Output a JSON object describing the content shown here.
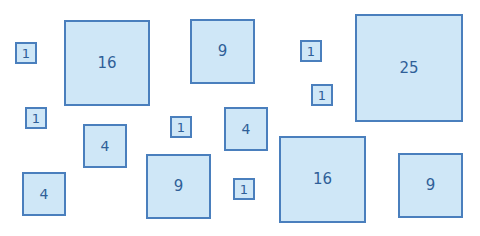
{
  "diagram": {
    "colors": {
      "fill": "#cfe7f7",
      "border": "#4a7fbd",
      "label": "#2f5f98",
      "background": "#ffffff"
    },
    "squares": [
      {
        "label": "1",
        "x": 15,
        "y": 42,
        "size": 22
      },
      {
        "label": "16",
        "x": 64,
        "y": 20,
        "size": 86
      },
      {
        "label": "9",
        "x": 190,
        "y": 19,
        "size": 65
      },
      {
        "label": "1",
        "x": 300,
        "y": 40,
        "size": 22
      },
      {
        "label": "25",
        "x": 355,
        "y": 14,
        "size": 108
      },
      {
        "label": "1",
        "x": 311,
        "y": 84,
        "size": 22
      },
      {
        "label": "1",
        "x": 25,
        "y": 107,
        "size": 22
      },
      {
        "label": "4",
        "x": 83,
        "y": 124,
        "size": 44
      },
      {
        "label": "1",
        "x": 170,
        "y": 116,
        "size": 22
      },
      {
        "label": "4",
        "x": 224,
        "y": 107,
        "size": 44
      },
      {
        "label": "4",
        "x": 22,
        "y": 172,
        "size": 44
      },
      {
        "label": "9",
        "x": 146,
        "y": 154,
        "size": 65
      },
      {
        "label": "1",
        "x": 233,
        "y": 178,
        "size": 22
      },
      {
        "label": "16",
        "x": 279,
        "y": 136,
        "size": 87
      },
      {
        "label": "9",
        "x": 398,
        "y": 153,
        "size": 65
      }
    ]
  }
}
